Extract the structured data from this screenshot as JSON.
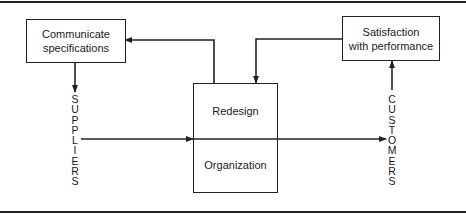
{
  "diagram": {
    "boxes": {
      "communicate": {
        "line1": "Communicate",
        "line2": "specifications"
      },
      "satisfaction": {
        "line1": "Satisfaction",
        "line2": "with performance"
      },
      "center": {
        "top": "Redesign",
        "bottom": "Organization"
      }
    },
    "labels": {
      "suppliers": [
        "S",
        "U",
        "P",
        "P",
        "L",
        "I",
        "E",
        "R",
        "S"
      ],
      "customers": [
        "C",
        "U",
        "S",
        "T",
        "O",
        "M",
        "E",
        "R",
        "S"
      ]
    },
    "flows": [
      {
        "from": "Communicate specifications",
        "to": "SUPPLIERS",
        "direction": "down"
      },
      {
        "from": "SUPPLIERS",
        "to": "Redesign/Organization",
        "direction": "right"
      },
      {
        "from": "Redesign/Organization",
        "to": "CUSTOMERS",
        "direction": "right"
      },
      {
        "from": "CUSTOMERS",
        "to": "Satisfaction with performance",
        "direction": "up"
      },
      {
        "from": "Satisfaction with performance",
        "to": "Redesign/Organization",
        "direction": "down"
      },
      {
        "from": "Redesign/Organization",
        "to": "Communicate specifications",
        "direction": "left"
      }
    ],
    "stroke_color": "#222222"
  }
}
